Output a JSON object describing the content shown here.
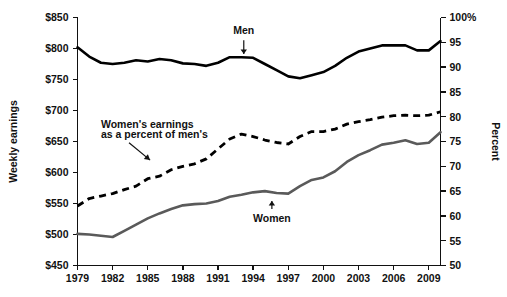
{
  "chart_data": {
    "type": "line",
    "title": "",
    "xlabel": "",
    "ylabel": "Weekly earnings",
    "y2label": "Percent",
    "grid": false,
    "legend": "annotations-inline",
    "x": [
      1979,
      1980,
      1981,
      1982,
      1983,
      1984,
      1985,
      1986,
      1987,
      1988,
      1989,
      1990,
      1991,
      1992,
      1993,
      1994,
      1995,
      1996,
      1997,
      1998,
      1999,
      2000,
      2001,
      2002,
      2003,
      2004,
      2005,
      2006,
      2007,
      2008,
      2009,
      2010
    ],
    "xlim": [
      1979,
      2010
    ],
    "xticks": [
      1979,
      1982,
      1985,
      1988,
      1991,
      1994,
      1997,
      2000,
      2003,
      2006,
      2009
    ],
    "xticklabels": [
      "1979",
      "1982",
      "1985",
      "1988",
      "1991",
      "1994",
      "1997",
      "2000",
      "2003",
      "2006",
      "2009"
    ],
    "ylim": [
      450,
      850
    ],
    "yticks": [
      450,
      500,
      550,
      600,
      650,
      700,
      750,
      800,
      850
    ],
    "yticklabels": [
      "$450",
      "$500",
      "$550",
      "$600",
      "$650",
      "$700",
      "$750",
      "$800",
      "$850"
    ],
    "y2lim": [
      50,
      100
    ],
    "y2ticks": [
      50,
      55,
      60,
      65,
      70,
      75,
      80,
      85,
      90,
      95,
      100
    ],
    "y2ticklabels": [
      "50",
      "55",
      "60",
      "65",
      "70",
      "75",
      "80",
      "85",
      "90",
      "95",
      "100%"
    ],
    "series": [
      {
        "name": "Men",
        "axis": "left",
        "style": "solid",
        "color": "#000000",
        "values": [
          802,
          787,
          777,
          775,
          777,
          781,
          779,
          783,
          781,
          776,
          775,
          772,
          777,
          786,
          786,
          785,
          775,
          765,
          755,
          752,
          757,
          762,
          772,
          785,
          795,
          800,
          805,
          805,
          805,
          797,
          797,
          812
        ]
      },
      {
        "name": "Women",
        "axis": "left",
        "style": "solid",
        "color": "#5a5a5a",
        "values": [
          501,
          500,
          498,
          496,
          506,
          516,
          526,
          534,
          541,
          547,
          549,
          550,
          554,
          561,
          564,
          568,
          570,
          567,
          566,
          578,
          588,
          592,
          602,
          617,
          628,
          636,
          645,
          648,
          652,
          646,
          648,
          665
        ]
      },
      {
        "name": "Women's earnings as a percent of men's",
        "axis": "right",
        "style": "dashed",
        "color": "#000000",
        "values": [
          62.0,
          63.5,
          64.0,
          64.5,
          65.3,
          66.0,
          67.5,
          68.0,
          69.3,
          70.0,
          70.5,
          71.5,
          73.5,
          75.5,
          76.5,
          76.0,
          75.3,
          74.8,
          74.5,
          76.0,
          77.0,
          77.0,
          77.5,
          78.5,
          79.0,
          79.4,
          79.9,
          80.2,
          80.3,
          80.2,
          80.3,
          81.0
        ]
      }
    ],
    "annotations": [
      {
        "name": "men-label",
        "text": "Men",
        "x": 1993.2,
        "y": 823,
        "arrow_to": [
          1993.2,
          783
        ]
      },
      {
        "name": "women-label",
        "text": "Women",
        "x": 1995.6,
        "y": 520,
        "arrow_to": [
          1995.6,
          562
        ]
      },
      {
        "name": "ratio-label-line1",
        "text": "Women's earnings",
        "x": 1981.0,
        "y": 672
      },
      {
        "name": "ratio-label-line2",
        "text": "as a percent of men's",
        "x": 1981.0,
        "y": 655
      }
    ]
  }
}
